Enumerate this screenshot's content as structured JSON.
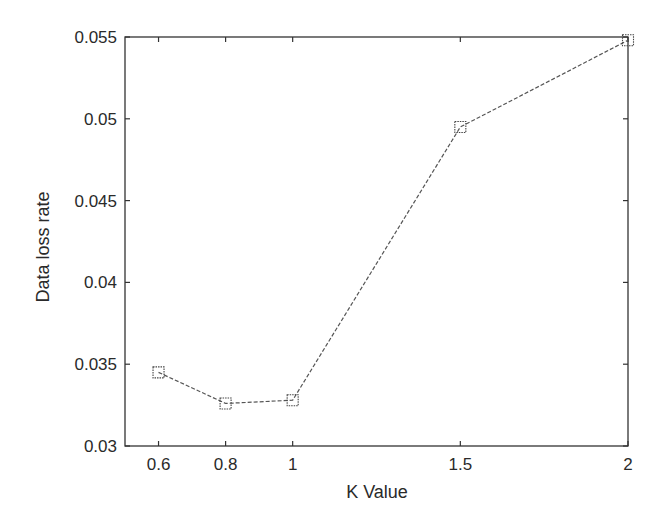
{
  "chart_data": {
    "type": "line",
    "title": "",
    "xlabel": "K Value",
    "ylabel": "Data loss rate",
    "x": [
      0.6,
      0.8,
      1,
      1.5,
      2
    ],
    "series": [
      {
        "name": "Data loss rate",
        "values": [
          0.0345,
          0.0326,
          0.0328,
          0.0495,
          0.0548
        ],
        "marker": "square",
        "line_style": "dashed",
        "color": "#555555"
      }
    ],
    "xlim": [
      0.5,
      2
    ],
    "ylim": [
      0.03,
      0.055
    ],
    "xticks": [
      0.6,
      0.8,
      1,
      1.5,
      2
    ],
    "xtick_labels": [
      "0.6",
      "0.8",
      "1",
      "1.5",
      "2"
    ],
    "yticks": [
      0.03,
      0.035,
      0.04,
      0.045,
      0.05,
      0.055
    ],
    "ytick_labels": [
      "0.03",
      "0.035",
      "0.04",
      "0.045",
      "0.05",
      "0.055"
    ],
    "grid": false,
    "legend": null
  }
}
